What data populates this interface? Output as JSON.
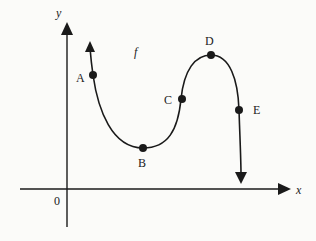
{
  "diagram": {
    "function_label": "f",
    "axes": {
      "x_label": "x",
      "y_label": "y",
      "origin_label": "0"
    },
    "points": [
      {
        "id": "A",
        "label": "A",
        "x": 93,
        "y": 75
      },
      {
        "id": "B",
        "label": "B",
        "x": 143,
        "y": 148
      },
      {
        "id": "C",
        "label": "C",
        "x": 181,
        "y": 99
      },
      {
        "id": "D",
        "label": "D",
        "x": 211,
        "y": 55
      },
      {
        "id": "E",
        "label": "E",
        "x": 239,
        "y": 110
      }
    ],
    "colors": {
      "ink": "#1a1a1a",
      "background": "#fbfbf9"
    }
  }
}
